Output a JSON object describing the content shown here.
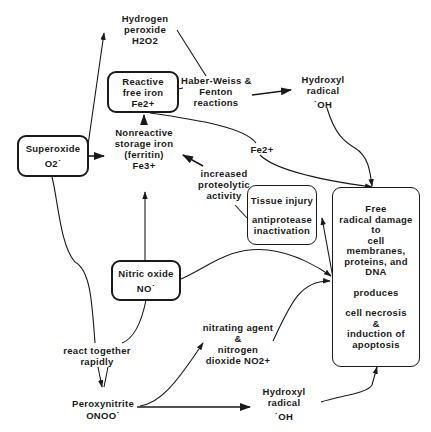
{
  "diagram": {
    "type": "flowchart",
    "nodes": {
      "hydrogen_peroxide": {
        "lines": [
          "Hydrogen",
          "peroxide",
          "H2O2"
        ]
      },
      "reactive_iron": {
        "lines": [
          "Reactive",
          "free iron",
          "Fe2+"
        ]
      },
      "haber_weiss": {
        "lines": [
          "Haber-Weiss &",
          "Fenton",
          "reactions"
        ]
      },
      "hydroxyl_top": {
        "lines": [
          "Hydroxyl",
          "radical",
          "˙OH"
        ]
      },
      "superoxide": {
        "lines": [
          "Superoxide",
          "O2˙"
        ]
      },
      "nonreactive_iron": {
        "lines": [
          "Nonreactive",
          "storage iron",
          "(ferritin)",
          "Fe3+"
        ]
      },
      "fe2_label": {
        "lines": [
          "Fe2+"
        ]
      },
      "proteolytic": {
        "lines": [
          "increased",
          "proteolytic",
          "activity"
        ]
      },
      "tissue_injury": {
        "lines": [
          "Tissue injury",
          "",
          "antiprotease",
          "inactivation"
        ]
      },
      "free_radical_damage": {
        "lines": [
          "Free",
          "radical damage",
          "to",
          "cell",
          "membranes,",
          "proteins, and",
          "DNA",
          "",
          "produces",
          "",
          "cell necrosis",
          "&",
          "induction of",
          "apoptosis"
        ]
      },
      "nitric_oxide": {
        "lines": [
          "Nitric oxide",
          "NO˙"
        ]
      },
      "react_together": {
        "lines": [
          "react together",
          "rapidly"
        ]
      },
      "nitrating_agent": {
        "lines": [
          "nitrating agent",
          "&",
          "nitrogen",
          "dioxide NO2+"
        ]
      },
      "peroxynitrite": {
        "lines": [
          "Peroxynitrite",
          "ONOO˙"
        ]
      },
      "hydroxyl_bottom": {
        "lines": [
          "Hydroxyl",
          "radical",
          "˙OH"
        ]
      }
    },
    "edges": [
      {
        "from": "superoxide",
        "to": "hydrogen_peroxide"
      },
      {
        "from": "superoxide",
        "to": "nonreactive_iron"
      },
      {
        "from": "superoxide",
        "to": "react_together"
      },
      {
        "from": "nonreactive_iron",
        "to": "reactive_iron"
      },
      {
        "from": "hydrogen_peroxide",
        "to": "haber_weiss"
      },
      {
        "from": "reactive_iron",
        "to": "haber_weiss"
      },
      {
        "from": "haber_weiss",
        "to": "hydroxyl_top"
      },
      {
        "from": "hydroxyl_top",
        "to": "free_radical_damage"
      },
      {
        "from": "reactive_iron",
        "to": "free_radical_damage",
        "label": "Fe2+"
      },
      {
        "from": "tissue_injury",
        "to": "nonreactive_iron",
        "label": "increased proteolytic activity"
      },
      {
        "from": "free_radical_damage",
        "to": "tissue_injury"
      },
      {
        "from": "nitric_oxide",
        "to": "nonreactive_iron"
      },
      {
        "from": "nitric_oxide",
        "to": "free_radical_damage"
      },
      {
        "from": "nitric_oxide",
        "to": "react_together"
      },
      {
        "from": "react_together",
        "to": "peroxynitrite"
      },
      {
        "from": "peroxynitrite",
        "to": "nitrating_agent"
      },
      {
        "from": "peroxynitrite",
        "to": "hydroxyl_bottom"
      },
      {
        "from": "nitrating_agent",
        "to": "free_radical_damage"
      },
      {
        "from": "hydroxyl_bottom",
        "to": "free_radical_damage"
      }
    ]
  }
}
